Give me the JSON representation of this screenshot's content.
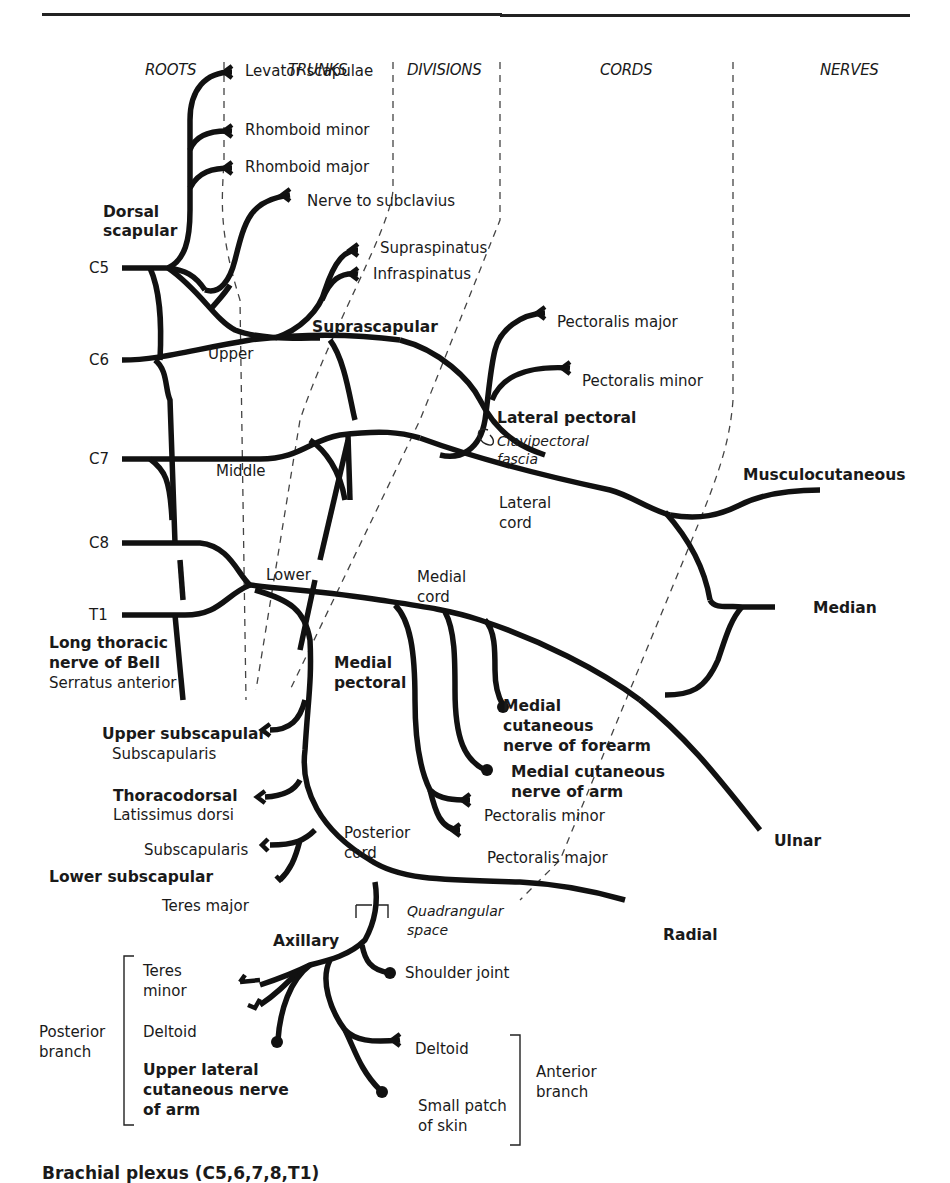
{
  "headers": {
    "roots": "ROOTS",
    "trunks": "TRUNKS",
    "divisions": "DIVISIONS",
    "cords": "CORDS",
    "nerves": "NERVES"
  },
  "roots": [
    "C5",
    "C6",
    "C7",
    "C8",
    "T1"
  ],
  "trunks": {
    "upper": "Upper",
    "middle": "Middle",
    "lower": "Lower"
  },
  "cords": {
    "lateral": [
      "Lateral",
      "cord"
    ],
    "medial": [
      "Medial",
      "cord"
    ],
    "posterior": [
      "Posterior",
      "cord"
    ]
  },
  "dorsal_scapular": {
    "name": [
      "Dorsal",
      "scapular"
    ],
    "branches": [
      "Levator scapulae",
      "Rhomboid minor",
      "Rhomboid major"
    ]
  },
  "nerve_to_subclavius": "Nerve to subclavius",
  "suprascapular": {
    "name": "Suprascapular",
    "branches": [
      "Supraspinatus",
      "Infraspinatus"
    ]
  },
  "lateral_pectoral": {
    "name": "Lateral pectoral",
    "branches": [
      "Pectoralis major",
      "Pectoralis minor"
    ],
    "note": [
      "Clavipectoral",
      "fascia"
    ]
  },
  "long_thoracic": {
    "name": [
      "Long thoracic",
      "nerve of Bell"
    ],
    "target": "Serratus anterior"
  },
  "medial_pectoral": {
    "name": [
      "Medial",
      "pectoral"
    ],
    "branches": [
      "Pectoralis minor",
      "Pectoralis major"
    ]
  },
  "medial_cutaneous_forearm": [
    "Medial",
    "cutaneous",
    "nerve of forearm"
  ],
  "medial_cutaneous_arm": [
    "Medial cutaneous",
    "nerve of arm"
  ],
  "upper_subscapular": {
    "name": "Upper subscapular",
    "target": "Subscapularis"
  },
  "thoracodorsal": {
    "name": "Thoracodorsal",
    "target": "Latissimus dorsi"
  },
  "lower_subscapular": {
    "name": "Lower subscapular",
    "targets": [
      "Subscapularis",
      "Teres major"
    ]
  },
  "terminal_nerves": {
    "musculocutaneous": "Musculocutaneous",
    "median": "Median",
    "ulnar": "Ulnar",
    "radial": "Radial"
  },
  "axillary": {
    "name": "Axillary",
    "quadrangular_space": [
      "Quadrangular",
      "space"
    ],
    "shoulder_joint": "Shoulder joint",
    "posterior_branch": {
      "label": [
        "Posterior",
        "branch"
      ],
      "teres_minor": [
        "Teres",
        "minor"
      ],
      "deltoid": "Deltoid",
      "upper_lateral_cutaneous": [
        "Upper lateral",
        "cutaneous nerve",
        "of arm"
      ]
    },
    "anterior_branch": {
      "label": [
        "Anterior",
        "branch"
      ],
      "deltoid": "Deltoid",
      "skin": [
        "Small patch",
        "of skin"
      ]
    }
  },
  "caption": "Brachial plexus (C5,6,7,8,T1)"
}
